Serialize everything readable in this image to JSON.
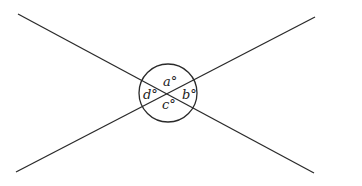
{
  "diagram": {
    "stroke_color": "#2a2a2a",
    "background": "#ffffff",
    "lines": [
      {
        "name": "line-1",
        "x1": 18,
        "y1": 14,
        "x2": 314,
        "y2": 173
      },
      {
        "name": "line-2",
        "x1": 16,
        "y1": 172,
        "x2": 315,
        "y2": 17
      }
    ],
    "circle": {
      "cx": 168,
      "cy": 93,
      "r": 29
    },
    "angles": [
      {
        "id": "a",
        "label": "a°",
        "x": 164,
        "y": 85
      },
      {
        "id": "b",
        "label": "b°",
        "x": 182,
        "y": 98
      },
      {
        "id": "c",
        "label": "c°",
        "x": 163,
        "y": 108
      },
      {
        "id": "d",
        "label": "d°",
        "x": 144,
        "y": 98
      }
    ]
  }
}
